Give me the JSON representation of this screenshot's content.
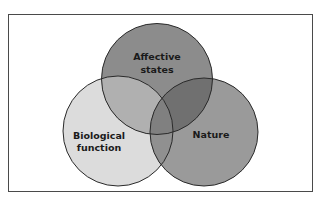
{
  "diagram": {
    "type": "venn",
    "sets": [
      {
        "id": "affective",
        "label_lines": [
          "Affective",
          "states"
        ],
        "color": "#8c8c8c"
      },
      {
        "id": "biological",
        "label_lines": [
          "Biological",
          "function"
        ],
        "color": "#dcdcdc"
      },
      {
        "id": "nature",
        "label_lines": [
          "Nature"
        ],
        "color": "#9a9a9a"
      }
    ],
    "overlap_colors": {
      "affective_biological": "#b0b0b0",
      "affective_nature": "#707070",
      "biological_nature": "#909090",
      "all": "#808080"
    },
    "stroke_color": "#2a2a2a",
    "frame_color": "#4a4a4a"
  }
}
